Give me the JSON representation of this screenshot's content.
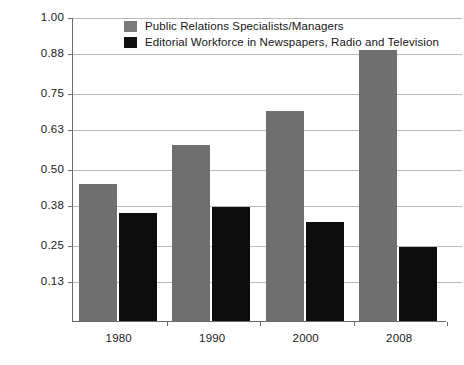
{
  "chart_data": {
    "type": "bar",
    "title": "",
    "xlabel": "",
    "ylabel": "Per 100,000 people",
    "categories": [
      "1980",
      "1990",
      "2000",
      "2008"
    ],
    "series": [
      {
        "name": "Public Relations Specialists/Managers",
        "color": "#6f6f6f",
        "values": [
          0.45,
          0.58,
          0.69,
          0.89
        ]
      },
      {
        "name": "Editorial Workforce in Newspapers, Radio and Television",
        "color": "#0d0d0d",
        "values": [
          0.355,
          0.375,
          0.325,
          0.245
        ]
      }
    ],
    "ylim": [
      0,
      1.0
    ],
    "yticks": [
      0.13,
      0.25,
      0.38,
      0.5,
      0.63,
      0.75,
      0.88,
      1.0
    ],
    "ytick_labels": [
      "0.13",
      "0.25",
      "0.38",
      "0.63",
      "0.50",
      "0.75",
      "0.88",
      "1.00"
    ],
    "grid": true,
    "legend_position": "top-center"
  },
  "axis": {
    "y_title": "Per 100,000 people",
    "y_ticks": [
      "1.00",
      "0.88",
      "0.75",
      "0.63",
      "0.50",
      "0.38",
      "0.25",
      "0.13"
    ],
    "x_ticks": [
      "1980",
      "1990",
      "2000",
      "2008"
    ]
  },
  "legend": {
    "items": [
      {
        "label": "Public Relations Specialists/Managers",
        "swatch": "gray"
      },
      {
        "label": "Editorial Workforce in Newspapers, Radio and Television",
        "swatch": "black"
      }
    ]
  },
  "title_sliver": ""
}
